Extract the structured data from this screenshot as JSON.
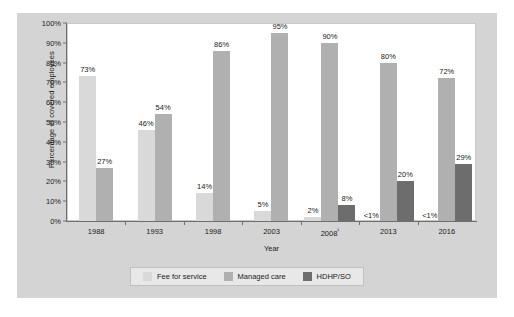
{
  "chart_data": {
    "type": "bar",
    "title": "",
    "subtitle": "",
    "xlabel": "Year",
    "ylabel": "Percentage of covered employees",
    "categories": [
      "1988",
      "1993",
      "1998",
      "2003",
      "2008¹",
      "2013",
      "2016"
    ],
    "category_labels_plain": [
      "1988",
      "1993",
      "1998",
      "2003",
      "2008",
      "2013",
      "2016"
    ],
    "ylim": [
      0,
      100
    ],
    "yticks": [
      0,
      10,
      20,
      30,
      40,
      50,
      60,
      70,
      80,
      90,
      100
    ],
    "ytick_labels": [
      "0%",
      "10%",
      "20%",
      "30%",
      "40%",
      "50%",
      "60%",
      "70%",
      "80%",
      "90%",
      "100%"
    ],
    "grid": false,
    "legend_position": "bottom",
    "series": [
      {
        "name": "Fee for service",
        "color": "#d9d9d9",
        "values": [
          73,
          27,
          14,
          5,
          2,
          0.5,
          0.5
        ],
        "labels": [
          "73%",
          "46%",
          "14%",
          "5%",
          "2%",
          "<1%",
          "<1%"
        ]
      },
      {
        "name": "Managed care",
        "color": "#b0b0b0",
        "values": [
          27,
          54,
          86,
          95,
          90,
          80,
          72
        ],
        "labels": [
          "27%",
          "54%",
          "86%",
          "95%",
          "90%",
          "80%",
          "72%"
        ]
      },
      {
        "name": "HDHP/SO",
        "color": "#6d6d6d",
        "values": [
          null,
          null,
          null,
          null,
          8,
          20,
          29
        ],
        "labels": [
          "",
          "",
          "",
          "",
          "8%",
          "20%",
          "29%"
        ]
      }
    ],
    "groups": [
      {
        "category": "1988",
        "bars": [
          {
            "series": "Fee for service",
            "value": 73,
            "label": "73%",
            "rendered": true
          },
          {
            "series": "Managed care",
            "value": 27,
            "label": "27%",
            "rendered": true
          }
        ]
      },
      {
        "category": "1993",
        "bars": [
          {
            "series": "Fee for service",
            "value": 46,
            "label": "46%",
            "rendered": true
          },
          {
            "series": "Managed care",
            "value": 54,
            "label": "54%",
            "rendered": true
          }
        ]
      },
      {
        "category": "1998",
        "bars": [
          {
            "series": "Fee for service",
            "value": 14,
            "label": "14%",
            "rendered": true
          },
          {
            "series": "Managed care",
            "value": 86,
            "label": "86%",
            "rendered": true
          }
        ]
      },
      {
        "category": "2003",
        "bars": [
          {
            "series": "Fee for service",
            "value": 5,
            "label": "5%",
            "rendered": true
          },
          {
            "series": "Managed care",
            "value": 95,
            "label": "95%",
            "rendered": true
          }
        ]
      },
      {
        "category": "2008¹",
        "bars": [
          {
            "series": "Fee for service",
            "value": 2,
            "label": "2%",
            "rendered": true
          },
          {
            "series": "Managed care",
            "value": 90,
            "label": "90%",
            "rendered": true
          },
          {
            "series": "HDHP/SO",
            "value": 8,
            "label": "8%",
            "rendered": true
          }
        ]
      },
      {
        "category": "2013",
        "bars": [
          {
            "series": "Fee for service",
            "value": 0.5,
            "label": "<1%",
            "rendered": false
          },
          {
            "series": "Managed care",
            "value": 80,
            "label": "80%",
            "rendered": true
          },
          {
            "series": "HDHP/SO",
            "value": 20,
            "label": "20%",
            "rendered": true
          }
        ]
      },
      {
        "category": "2016",
        "bars": [
          {
            "series": "Fee for service",
            "value": 0.5,
            "label": "<1%",
            "rendered": false
          },
          {
            "series": "Managed care",
            "value": 72,
            "label": "72%",
            "rendered": true
          },
          {
            "series": "HDHP/SO",
            "value": 29,
            "label": "29%",
            "rendered": true
          }
        ]
      }
    ]
  },
  "legend": {
    "items": [
      {
        "label": "Fee for service",
        "color": "#d9d9d9"
      },
      {
        "label": "Managed care",
        "color": "#b0b0b0"
      },
      {
        "label": "HDHP/SO",
        "color": "#6d6d6d"
      }
    ]
  },
  "axis": {
    "y_title": "Percentage of covered employees",
    "x_title": "Year"
  },
  "colors": {
    "figure_background": "#d4d4d4",
    "plot_background": "#ffffff",
    "axis_line": "#6e6e6e",
    "text": "#1a1a1a",
    "legend_background": "#e8e8e8",
    "series_fee_for_service": "#d9d9d9",
    "series_managed_care": "#b0b0b0",
    "series_hdhp_so": "#6d6d6d"
  }
}
